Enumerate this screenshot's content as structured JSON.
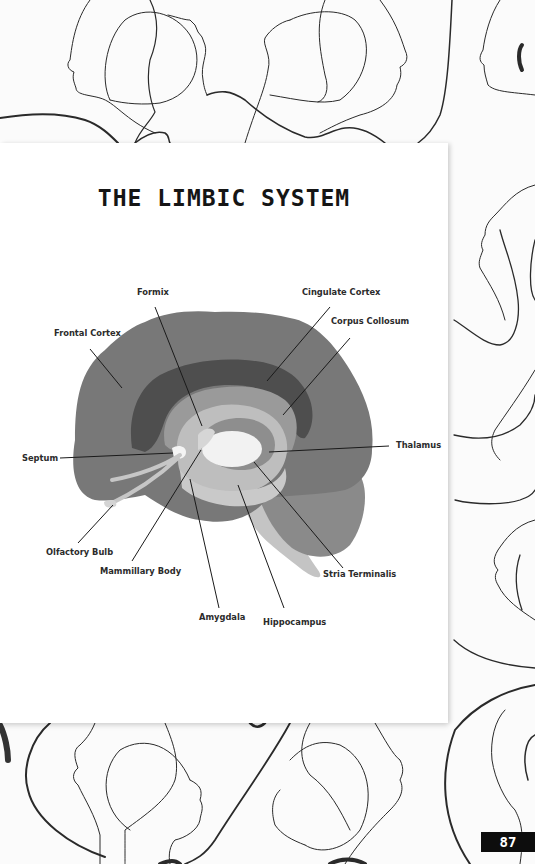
{
  "page": {
    "title": "THE LIMBIC SYSTEM",
    "page_number": "87"
  },
  "diagram": {
    "labels": {
      "formix": "Formix",
      "frontal_cortex": "Frontal  Cortex",
      "cingulate_cortex": "Cingulate Cortex",
      "corpus_collosum": "Corpus Collosum",
      "septum": "Septum",
      "thalamus": "Thalamus",
      "olfactory_bulb": "Olfactory Bulb",
      "mammillary_body": "Mammillary Body",
      "stria_terminalis": "Stria Terminalis",
      "amygdala": "Amygdala",
      "hippocampus": "Hippocampus"
    },
    "colors": {
      "cortex": "#7a7a7a",
      "cingulate": "#4f4f4f",
      "corpus": "#999999",
      "inner_ring": "#bdbdbd",
      "thalamus": "#f2f2f2",
      "brainstem": "#c8c8c8",
      "cerebellum": "#8a8a8a",
      "leader_line": "#1a1a1a"
    }
  },
  "background": {
    "motif": "line-art face profiles"
  }
}
